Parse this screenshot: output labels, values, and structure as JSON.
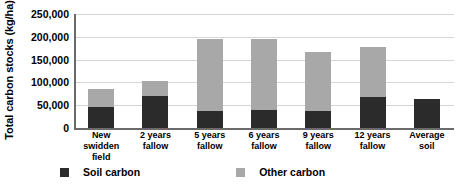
{
  "chart_data": {
    "type": "bar",
    "subtype": "stacked-bar",
    "title": "",
    "xlabel": "",
    "ylabel": "Total carbon stocks (kg/ha)",
    "ylim": [
      0,
      250000
    ],
    "ytick_step": 50000,
    "ytick_labels": [
      "250,000",
      "200,000",
      "150,000",
      "100,000",
      "50,000",
      "0"
    ],
    "ytick_values": [
      250000,
      200000,
      150000,
      100000,
      50000,
      0
    ],
    "grid": true,
    "legend_position": "bottom",
    "categories": [
      "New swidden field",
      "2 years fallow",
      "5 years fallow",
      "6 years fallow",
      "9 years fallow",
      "12 years fallow",
      "Average soil"
    ],
    "category_lines": [
      [
        "New",
        "swidden field"
      ],
      [
        "2 years",
        "fallow"
      ],
      [
        "5 years",
        "fallow"
      ],
      [
        "6 years",
        "fallow"
      ],
      [
        "9 years",
        "fallow"
      ],
      [
        "12 years",
        "fallow"
      ],
      [
        "Average",
        "soil"
      ]
    ],
    "series": [
      {
        "name": "Soil carbon",
        "color": "#2b2b2b",
        "values": [
          46000,
          70000,
          38000,
          40000,
          38000,
          67000,
          64000
        ]
      },
      {
        "name": "Other carbon",
        "color": "#a8a8a8",
        "values": [
          40000,
          33000,
          158000,
          155000,
          129000,
          110000,
          0
        ]
      }
    ],
    "totals": [
      86000,
      103000,
      196000,
      195000,
      167000,
      177000,
      64000
    ]
  },
  "legend": {
    "items": [
      {
        "label": "Soil carbon",
        "color": "#2b2b2b"
      },
      {
        "label": "Other carbon",
        "color": "#a8a8a8"
      }
    ]
  }
}
